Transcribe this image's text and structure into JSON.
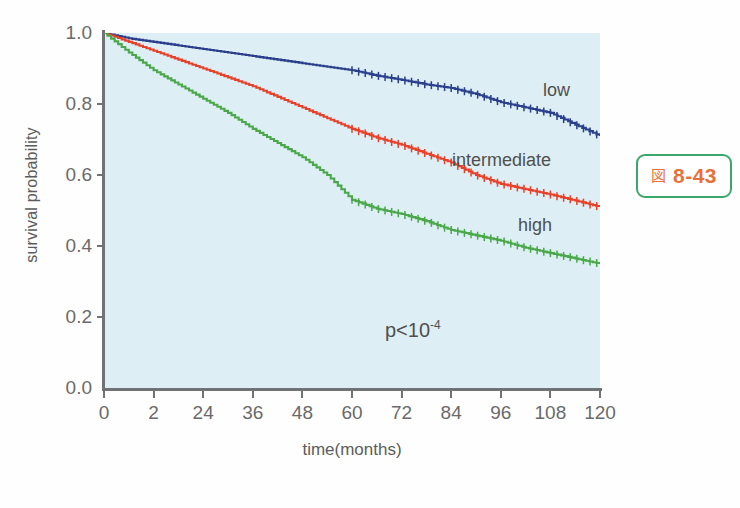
{
  "chart_data": {
    "type": "line",
    "title": "",
    "subtitle": "",
    "xlabel": "time(months)",
    "ylabel": "survival probability",
    "xlim": [
      0,
      120
    ],
    "ylim": [
      0.0,
      1.0
    ],
    "grid": false,
    "legend_position": "inline-right",
    "x_ticks": [
      {
        "value": 0,
        "label": "0"
      },
      {
        "value": 12,
        "label": "2"
      },
      {
        "value": 24,
        "label": "24"
      },
      {
        "value": 36,
        "label": "36"
      },
      {
        "value": 48,
        "label": "48"
      },
      {
        "value": 60,
        "label": "60"
      },
      {
        "value": 72,
        "label": "72"
      },
      {
        "value": 84,
        "label": "84"
      },
      {
        "value": 96,
        "label": "96"
      },
      {
        "value": 108,
        "label": "108"
      },
      {
        "value": 120,
        "label": "120"
      }
    ],
    "y_ticks": [
      {
        "value": 0.0,
        "label": "0.0"
      },
      {
        "value": 0.2,
        "label": "0.2"
      },
      {
        "value": 0.4,
        "label": "0.4"
      },
      {
        "value": 0.6,
        "label": "0.6"
      },
      {
        "value": 0.8,
        "label": "0.8"
      },
      {
        "value": 1.0,
        "label": "1.0"
      }
    ],
    "annotations": [
      {
        "name": "p-value",
        "text": "p<10",
        "exponent": "-4"
      }
    ],
    "series": [
      {
        "name": "low",
        "label": "low",
        "color": "#2b3f8c",
        "x": [
          0,
          6,
          12,
          18,
          24,
          30,
          36,
          42,
          48,
          54,
          60,
          66,
          72,
          78,
          84,
          90,
          96,
          102,
          108,
          114,
          120
        ],
        "values": [
          1.0,
          0.985,
          0.975,
          0.965,
          0.955,
          0.945,
          0.935,
          0.925,
          0.915,
          0.905,
          0.895,
          0.88,
          0.868,
          0.855,
          0.845,
          0.828,
          0.805,
          0.79,
          0.775,
          0.742,
          0.71
        ]
      },
      {
        "name": "intermediate",
        "label": "intermediate",
        "color": "#e8412a",
        "x": [
          0,
          6,
          12,
          18,
          24,
          30,
          36,
          42,
          48,
          54,
          60,
          66,
          72,
          78,
          84,
          90,
          96,
          102,
          108,
          114,
          120
        ],
        "values": [
          1.0,
          0.975,
          0.95,
          0.925,
          0.9,
          0.875,
          0.85,
          0.82,
          0.79,
          0.76,
          0.73,
          0.705,
          0.685,
          0.66,
          0.635,
          0.6,
          0.575,
          0.56,
          0.545,
          0.528,
          0.51
        ]
      },
      {
        "name": "high",
        "label": "high",
        "color": "#4aa84a",
        "x": [
          0,
          6,
          12,
          18,
          24,
          30,
          36,
          42,
          48,
          54,
          60,
          66,
          72,
          78,
          84,
          90,
          96,
          102,
          108,
          114,
          120
        ],
        "values": [
          1.0,
          0.945,
          0.895,
          0.855,
          0.815,
          0.775,
          0.73,
          0.69,
          0.65,
          0.6,
          0.53,
          0.505,
          0.49,
          0.47,
          0.445,
          0.43,
          0.415,
          0.395,
          0.38,
          0.365,
          0.35
        ]
      }
    ]
  },
  "series_labels": {
    "low": "low",
    "intermediate": "intermediate",
    "high": "high"
  },
  "figure_caption": {
    "glyph": "図",
    "number": "8-43"
  },
  "colors": {
    "plot_background": "#ddeff4",
    "axis": "#6e7476",
    "tick_text": "#6a6a6a",
    "caption_border": "#3aa86b",
    "caption_text": "#e8703a"
  }
}
